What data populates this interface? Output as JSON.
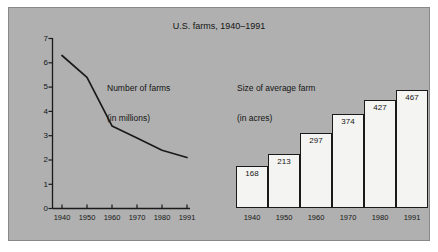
{
  "chart_data": {
    "type": "line",
    "title": "U.S. farms, 1940–1991",
    "panels": [
      {
        "name": "number-of-farms",
        "type": "line",
        "annotation_line1": "Number of farms",
        "annotation_line2": "(in millions)",
        "xlabel": "",
        "ylabel": "",
        "ylim": [
          0,
          7
        ],
        "yticks": [
          "7",
          "6",
          "5",
          "4",
          "3",
          "2",
          "1",
          "0"
        ],
        "categories": [
          "1940",
          "1950",
          "1960",
          "1970",
          "1980",
          "1991"
        ],
        "values": [
          6.3,
          5.4,
          3.4,
          2.9,
          2.4,
          2.1
        ],
        "grid": false,
        "legend": "none"
      },
      {
        "name": "size-of-average-farm",
        "type": "bar",
        "annotation_line1": "Size of average farm",
        "annotation_line2": "(in acres)",
        "xlabel": "",
        "ylabel": "",
        "categories": [
          "1940",
          "1950",
          "1960",
          "1970",
          "1980",
          "1991"
        ],
        "values": [
          168,
          213,
          297,
          374,
          427,
          467
        ],
        "value_labels": [
          "168",
          "213",
          "297",
          "374",
          "427",
          "467"
        ],
        "grid": false,
        "legend": "none"
      }
    ]
  },
  "colors": {
    "panel_background": "#b0b0b0",
    "page_background": "#ffffff",
    "axis": "#1a1a1a",
    "line": "#1a1a1a",
    "bar_fill": "#f4f4f2",
    "bar_edge": "#1a1a1a",
    "text": "#141414"
  }
}
